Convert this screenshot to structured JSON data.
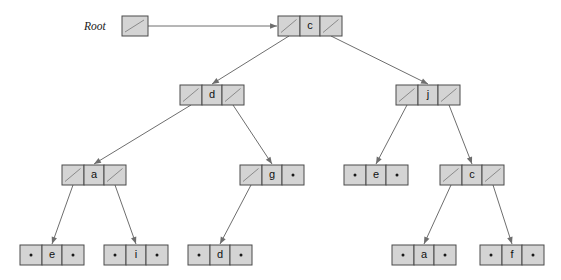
{
  "diagram": {
    "root_label": "Root",
    "colors": {
      "cell_fill": "#d4d4d4",
      "cell_stroke": "#4a4a4a",
      "edge": "#6e6e6e",
      "text": "#111111",
      "background": "#ffffff"
    },
    "root_pointer": {
      "name": "root-pointer-box",
      "x": 122,
      "y": 16,
      "w": 26,
      "h": 20,
      "has_pointer_slash": true
    },
    "arrow_root_to_node": {
      "from_x": 148,
      "from_y": 26,
      "to_x": 278,
      "to_y": 26
    },
    "nodes": [
      {
        "id": "n-c-root",
        "value": "c",
        "level": 1,
        "x": 278,
        "y": 16,
        "left": "pointer",
        "right": "pointer",
        "left_child": "n-d",
        "right_child": "n-j"
      },
      {
        "id": "n-d",
        "value": "d",
        "level": 2,
        "x": 180,
        "y": 85,
        "left": "pointer",
        "right": "pointer",
        "left_child": "n-a",
        "right_child": "n-g"
      },
      {
        "id": "n-j",
        "value": "j",
        "level": 2,
        "x": 396,
        "y": 85,
        "left": "pointer",
        "right": "pointer",
        "left_child": "n-e-mid",
        "right_child": "n-c-mid"
      },
      {
        "id": "n-a",
        "value": "a",
        "level": 3,
        "x": 62,
        "y": 165,
        "left": "pointer",
        "right": "pointer",
        "left_child": "n-e-leaf",
        "right_child": "n-i-leaf"
      },
      {
        "id": "n-g",
        "value": "g",
        "level": 3,
        "x": 240,
        "y": 165,
        "left": "pointer",
        "right": "null",
        "left_child": "n-d-leaf",
        "right_child": null
      },
      {
        "id": "n-e-mid",
        "value": "e",
        "level": 3,
        "x": 344,
        "y": 165,
        "left": "null",
        "right": "null",
        "left_child": null,
        "right_child": null
      },
      {
        "id": "n-c-mid",
        "value": "c",
        "level": 3,
        "x": 440,
        "y": 165,
        "left": "pointer",
        "right": "pointer",
        "left_child": "n-a-leaf",
        "right_child": "n-f-leaf"
      },
      {
        "id": "n-e-leaf",
        "value": "e",
        "level": 4,
        "x": 20,
        "y": 245,
        "left": "null",
        "right": "null",
        "left_child": null,
        "right_child": null
      },
      {
        "id": "n-i-leaf",
        "value": "i",
        "level": 4,
        "x": 104,
        "y": 245,
        "left": "null",
        "right": "null",
        "left_child": null,
        "right_child": null
      },
      {
        "id": "n-d-leaf",
        "value": "d",
        "level": 4,
        "x": 188,
        "y": 245,
        "left": "null",
        "right": "null",
        "left_child": null,
        "right_child": null
      },
      {
        "id": "n-a-leaf",
        "value": "a",
        "level": 4,
        "x": 392,
        "y": 245,
        "left": "null",
        "right": "null",
        "left_child": null,
        "right_child": null
      },
      {
        "id": "n-f-leaf",
        "value": "f",
        "level": 4,
        "x": 480,
        "y": 245,
        "left": "null",
        "right": "null",
        "left_child": null,
        "right_child": null
      }
    ],
    "node_geometry": {
      "cell_w": 22,
      "val_w": 20,
      "h": 20
    }
  }
}
